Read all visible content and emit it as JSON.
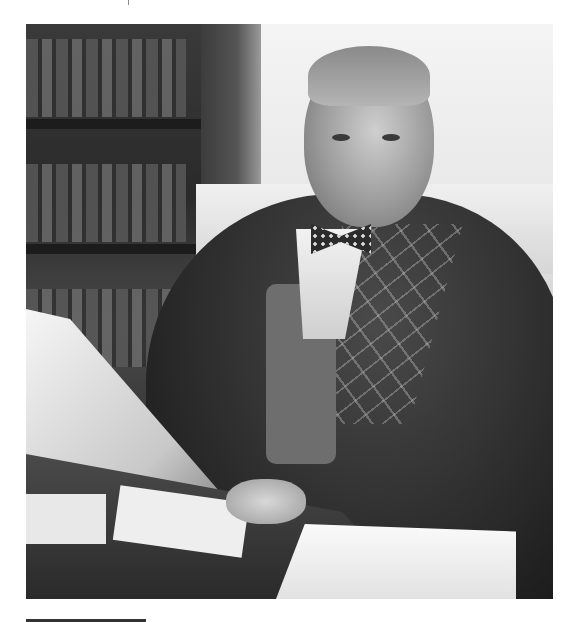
{
  "page": {
    "type": "scanned book page",
    "photo": {
      "description": "Black-and-white portrait of an elderly man with a bow tie and plaid-trimmed jacket seated at a desk holding papers, bookshelves behind him",
      "alt": "Portrait photograph"
    },
    "caption": {
      "text": "",
      "note": "Caption text cut off at bottom edge; only tops of glyphs visible"
    }
  }
}
